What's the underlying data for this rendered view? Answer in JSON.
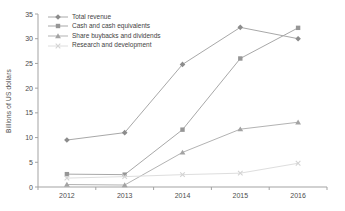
{
  "chart_data": {
    "type": "line",
    "title": "",
    "xlabel": "",
    "ylabel": "Billions of US dollars",
    "categories": [
      "2012",
      "2013",
      "2014",
      "2015",
      "2016"
    ],
    "ylim": [
      0,
      35
    ],
    "yticks": [
      0,
      5,
      10,
      15,
      20,
      25,
      30,
      35
    ],
    "grid": false,
    "legend_position": "top-left",
    "axis_color": "#a3a3a3",
    "text_color": "#4d4d4d",
    "series": [
      {
        "name": "Total revenue",
        "marker": "diamond",
        "marker_color": "#8c8c8c",
        "line_color": "#a8a8a8",
        "values": [
          9.5,
          11.0,
          24.8,
          32.3,
          30.0
        ]
      },
      {
        "name": "Cash and cash equivalents",
        "marker": "square",
        "marker_color": "#969696",
        "line_color": "#a8a8a8",
        "values": [
          2.6,
          2.5,
          11.6,
          26.0,
          32.2
        ]
      },
      {
        "name": "Share buybacks and dividends",
        "marker": "triangle",
        "marker_color": "#a3a3a3",
        "line_color": "#b3b3b3",
        "values": [
          0.5,
          0.4,
          7.0,
          11.7,
          13.1
        ]
      },
      {
        "name": "Research and development",
        "marker": "x-cross",
        "marker_color": "#d3d3d3",
        "line_color": "#dedede",
        "values": [
          1.8,
          2.1,
          2.5,
          2.8,
          4.8
        ]
      }
    ]
  }
}
